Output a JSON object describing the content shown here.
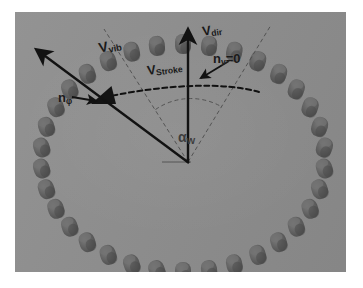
{
  "figure": {
    "background_color": "#8d8d8d",
    "element_color": "#5f5f5f",
    "annotation_color": "#1a1a1a",
    "dashed_color": "#4a4a4a"
  },
  "labels": {
    "v_vib": {
      "base": "V",
      "sub": "vib",
      "name": "vibration-velocity-vector-label"
    },
    "v_dir": {
      "base": "V",
      "sub": "dir",
      "name": "direction-velocity-vector-label"
    },
    "v_stroke": {
      "base": "V",
      "sub": "Stroke",
      "name": "stroke-velocity-vector-label"
    },
    "n_v": {
      "base": "n",
      "sub": "v",
      "suffix": "=0",
      "name": "nv-zero-label"
    },
    "n_phi": {
      "base": "n",
      "sub": "φ",
      "name": "n-phi-label"
    },
    "alpha_w": {
      "base": "α",
      "sub": "W",
      "name": "alpha-w-angle-label"
    }
  },
  "vectors": [
    {
      "name": "v-vib-arrow",
      "from": [
        173,
        150
      ],
      "to": [
        14,
        32
      ],
      "style": "solid",
      "head": "large"
    },
    {
      "name": "v-dir-arrow",
      "from": [
        173,
        150
      ],
      "to": [
        173,
        11
      ],
      "style": "solid",
      "head": "large"
    },
    {
      "name": "v-stroke-arrow",
      "from": [
        240,
        78
      ],
      "to": [
        80,
        84
      ],
      "style": "dashed",
      "head": "curved"
    },
    {
      "name": "n-phi-pointer",
      "from": [
        67,
        84
      ],
      "to": [
        88,
        88
      ],
      "style": "solid",
      "head": "small"
    },
    {
      "name": "nv-pointer",
      "from": [
        212,
        48
      ],
      "to": [
        185,
        66
      ],
      "style": "solid",
      "head": "small"
    },
    {
      "name": "n-phi-marker",
      "from": [
        110,
        80
      ],
      "to": [
        80,
        92
      ],
      "style": "solid",
      "head": "wedge"
    }
  ],
  "sector": {
    "name": "angle-sector",
    "vertex": [
      173,
      150
    ],
    "left_ray_end": [
      89,
      17
    ],
    "right_ray_end": [
      256,
      13
    ],
    "arc_radius": 60,
    "style": "dashed"
  },
  "ring": {
    "name": "cylinder-ring",
    "center": [
      168,
      146
    ],
    "radius_x": 142,
    "radius_y": 114,
    "count": 34,
    "element_width": 16,
    "element_height": 20
  }
}
